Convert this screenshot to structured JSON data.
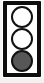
{
  "icon": {
    "name": "traffic-light",
    "housing_color": "#0d0d0d",
    "background_color": "#ffffff",
    "lit_lamp_color": "#575757",
    "unlit_lamp_color": "#ffffff",
    "lamp_outline_color": "#111111",
    "lamps": [
      {
        "position": "top",
        "semantic": "red-light",
        "state": "off",
        "label": ""
      },
      {
        "position": "middle",
        "semantic": "yellow-light",
        "state": "off",
        "label": ""
      },
      {
        "position": "bottom",
        "semantic": "green-light",
        "state": "on",
        "label": ""
      }
    ]
  }
}
